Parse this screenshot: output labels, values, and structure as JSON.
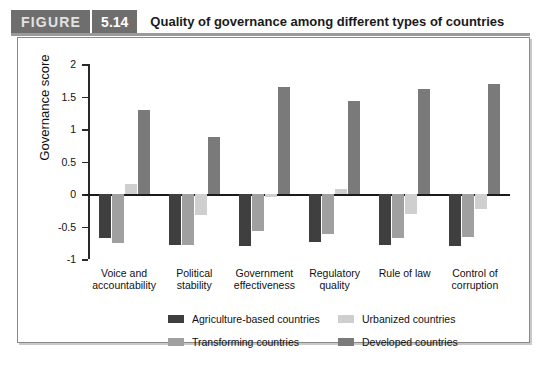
{
  "header": {
    "figure_word": "FIGURE",
    "figure_number": "5.14",
    "title": "Quality of governance among different types of countries"
  },
  "chart_data": {
    "type": "bar",
    "title": "Quality of governance among different types of countries",
    "xlabel": "",
    "ylabel": "Governance score",
    "ylim": [
      -1,
      2
    ],
    "yticks": [
      "2",
      "1.5",
      "1",
      "0.5",
      "0",
      "-0.5",
      "-1"
    ],
    "grid": false,
    "legend_position": "bottom",
    "categories": [
      "Voice and accountability",
      "Political stability",
      "Government effectiveness",
      "Regulatory quality",
      "Rule of law",
      "Control of corruption"
    ],
    "series": [
      {
        "name": "Agriculture-based countries",
        "color": "#3f3f3f",
        "values": [
          -0.67,
          -0.78,
          -0.8,
          -0.74,
          -0.79,
          -0.8
        ]
      },
      {
        "name": "Transforming countries",
        "color": "#a0a0a0",
        "values": [
          -0.75,
          -0.78,
          -0.57,
          -0.62,
          -0.68,
          -0.66
        ]
      },
      {
        "name": "Urbanized countries",
        "color": "#cfcfcf",
        "values": [
          0.15,
          -0.33,
          -0.04,
          0.07,
          -0.3,
          -0.23
        ]
      },
      {
        "name": "Developed countries",
        "color": "#7a7a7a",
        "values": [
          1.29,
          0.87,
          1.65,
          1.43,
          1.61,
          1.7
        ]
      }
    ]
  },
  "caption": "the notes"
}
